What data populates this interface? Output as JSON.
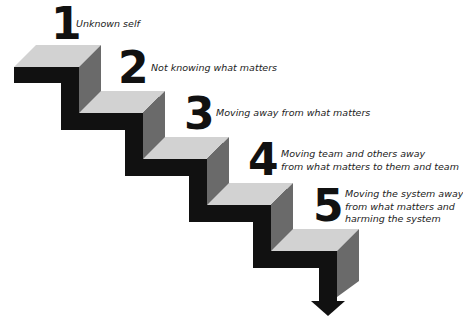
{
  "diagram": {
    "type": "descending-staircase",
    "colors": {
      "top_face": "#d2d2d2",
      "side_face": "#6a6a6a",
      "front_face": "#111111",
      "text": "#222222"
    },
    "steps": [
      {
        "number": "1",
        "lines": [
          "Unknown self"
        ]
      },
      {
        "number": "2",
        "lines": [
          "Not knowing what matters"
        ]
      },
      {
        "number": "3",
        "lines": [
          "Moving away from what matters"
        ]
      },
      {
        "number": "4",
        "lines": [
          "Moving team and others away",
          "from what matters to them and team"
        ]
      },
      {
        "number": "5",
        "lines": [
          "Moving the system away",
          "from what matters and",
          "harming the system"
        ]
      }
    ],
    "arrow": "down-arrow"
  }
}
